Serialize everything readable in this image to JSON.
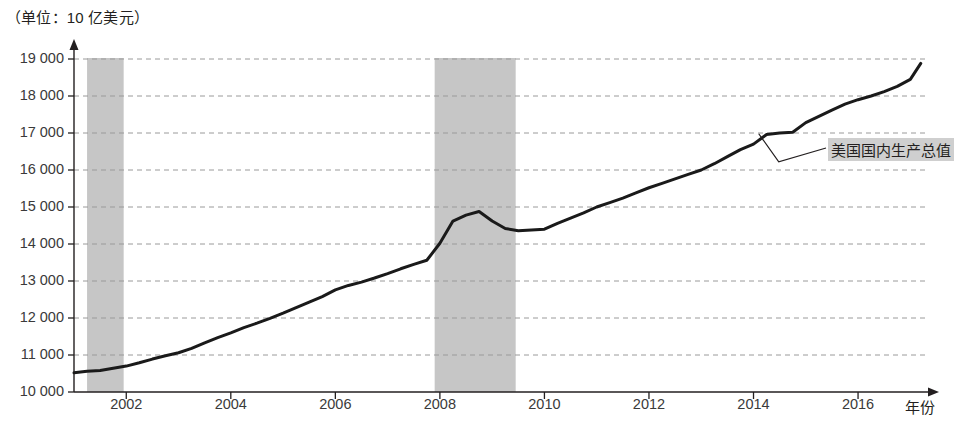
{
  "chart": {
    "unit_title": "（单位：10 亿美元）",
    "x_axis_name": "年份",
    "series_label": "美国国内生产总值"
  },
  "chart_data": {
    "type": "line",
    "title": "",
    "subtitle": "",
    "unit_note": "（单位：10 亿美元）",
    "xlabel": "年份",
    "ylabel": "",
    "xlim": [
      2001,
      2017.3
    ],
    "ylim": [
      10000,
      19000
    ],
    "grid": true,
    "legend_position": "right-inline-annotation",
    "x_ticks": [
      2002,
      2004,
      2006,
      2008,
      2010,
      2012,
      2014,
      2016
    ],
    "x_tick_labels": [
      "2002",
      "2004",
      "2006",
      "2008",
      "2010",
      "2012",
      "2014",
      "2016"
    ],
    "y_ticks": [
      10000,
      11000,
      12000,
      13000,
      14000,
      15000,
      16000,
      17000,
      18000,
      19000
    ],
    "y_tick_labels": [
      "10 000",
      "11 000",
      "12 000",
      "13 000",
      "14 000",
      "15 000",
      "16 000",
      "17 000",
      "18 000",
      "19 000"
    ],
    "shaded_bands": [
      {
        "name": "2001年经济衰退",
        "x_start": 2001.25,
        "x_end": 2001.95,
        "color": "#c6c6c6"
      },
      {
        "name": "2008年经济衰退",
        "x_start": 2007.9,
        "x_end": 2009.45,
        "color": "#c6c6c6"
      }
    ],
    "series": [
      {
        "name": "美国国内生产总值",
        "color": "#1a1a1a",
        "x": [
          2001.0,
          2001.25,
          2001.5,
          2001.75,
          2002.0,
          2002.25,
          2002.5,
          2002.75,
          2003.0,
          2003.25,
          2003.5,
          2003.75,
          2004.0,
          2004.25,
          2004.5,
          2004.75,
          2005.0,
          2005.25,
          2005.5,
          2005.75,
          2006.0,
          2006.25,
          2006.5,
          2006.75,
          2007.0,
          2007.25,
          2007.5,
          2007.75,
          2008.0,
          2008.25,
          2008.5,
          2008.75,
          2009.0,
          2009.25,
          2009.5,
          2009.75,
          2010.0,
          2010.25,
          2010.5,
          2010.75,
          2011.0,
          2011.25,
          2011.5,
          2011.75,
          2012.0,
          2012.25,
          2012.5,
          2012.75,
          2013.0,
          2013.25,
          2013.5,
          2013.75,
          2014.0,
          2014.25,
          2014.5,
          2014.75,
          2015.0,
          2015.25,
          2015.5,
          2015.75,
          2016.0,
          2016.25,
          2016.5,
          2016.75,
          2017.0,
          2017.2
        ],
        "values": [
          10520,
          10560,
          10580,
          10640,
          10700,
          10790,
          10890,
          10980,
          11060,
          11180,
          11330,
          11470,
          11600,
          11740,
          11860,
          11990,
          12130,
          12280,
          12430,
          12580,
          12760,
          12880,
          12970,
          13080,
          13200,
          13330,
          13450,
          13560,
          14020,
          14620,
          14780,
          14880,
          14620,
          14420,
          14360,
          14380,
          14400,
          14560,
          14700,
          14840,
          15000,
          15120,
          15240,
          15380,
          15520,
          15640,
          15760,
          15880,
          16000,
          16170,
          16360,
          16550,
          16700,
          16960,
          17000,
          17020,
          17280,
          17450,
          17620,
          17780,
          17900,
          18000,
          18120,
          18260,
          18450,
          18880
        ],
        "start_value": 10520,
        "end_value": 18880,
        "peak_pre_recession": {
          "x": 2008.75,
          "y": 14880
        },
        "trough": {
          "x": 2009.5,
          "y": 14360
        }
      }
    ]
  }
}
